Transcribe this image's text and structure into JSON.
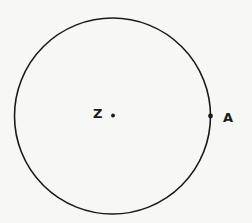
{
  "diagram": {
    "type": "geometry-circle",
    "stroke_color": "#1a1a1a",
    "background_color": "#f7f7f5",
    "points": [
      {
        "id": "center",
        "label": "Z",
        "role": "circle-center"
      },
      {
        "id": "a",
        "label": "A",
        "role": "point-on-circle"
      }
    ]
  }
}
